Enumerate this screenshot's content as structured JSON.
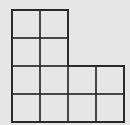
{
  "diagram": {
    "type": "L-shaped grid of unit squares",
    "background": "#e6e6e6",
    "line_color": "#2a2a2a",
    "cell_size": 28,
    "rows": [
      {
        "row": 1,
        "columns": 2
      },
      {
        "row": 2,
        "columns": 2
      },
      {
        "row": 3,
        "columns": 4
      },
      {
        "row": 4,
        "columns": 4
      }
    ],
    "total_squares": 12
  }
}
